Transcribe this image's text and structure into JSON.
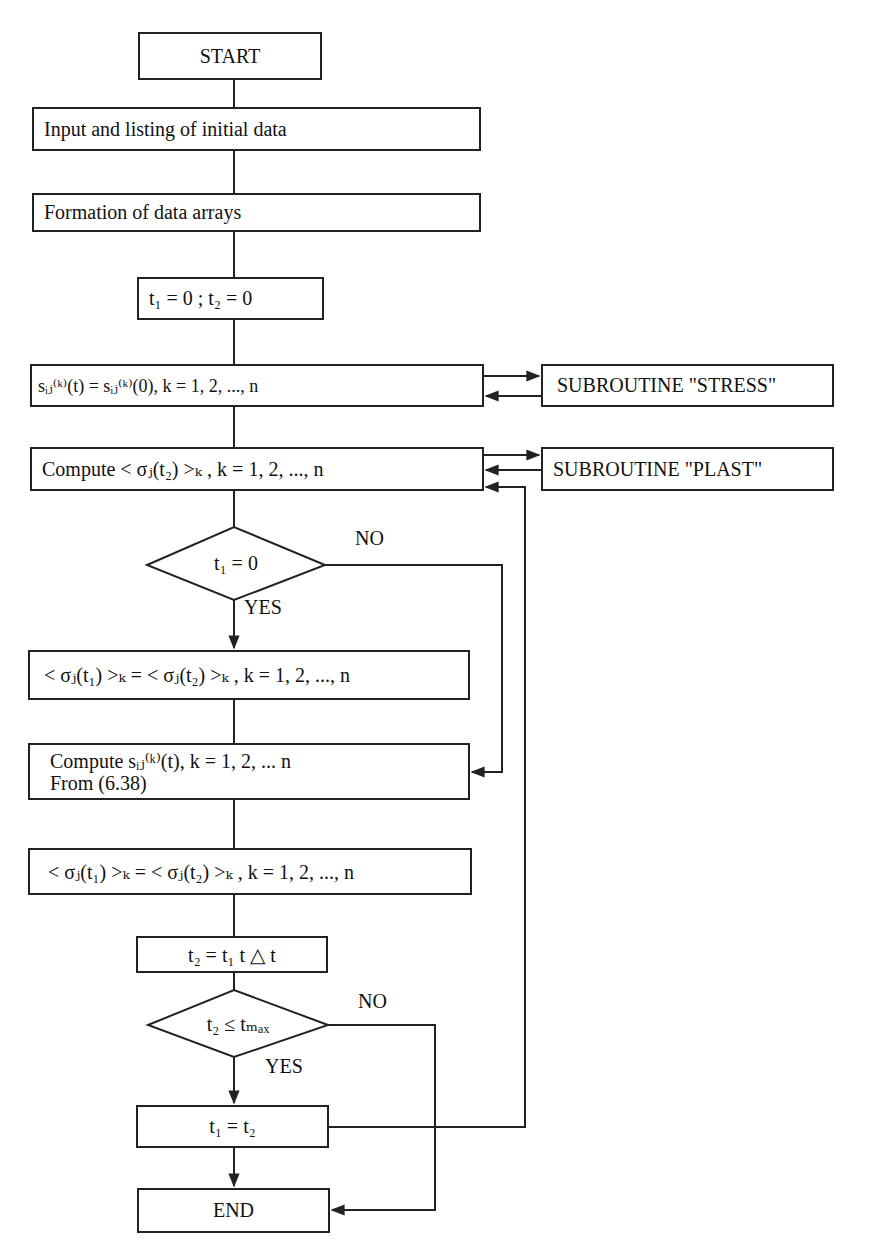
{
  "flowchart": {
    "start": "START",
    "input": "Input and listing of initial data",
    "formation": "Formation of data arrays",
    "init_t": "t₁ = 0 ; t₂ = 0",
    "init_s": "sᵢⱼ⁽ᵏ⁾(t) = sᵢⱼ⁽ᵏ⁾(0), k = 1, 2, ..., n",
    "compute_sigma": "Compute < σⱼ(t₂) >ₖ , k = 1, 2, ..., n",
    "decision1": "t₁ = 0",
    "decision1_no": "NO",
    "decision1_yes": "YES",
    "assign_sigma_1": "< σⱼ(t₁) >ₖ = < σⱼ(t₂) >ₖ , k = 1, 2, ..., n",
    "compute_s_line1": "Compute sᵢⱼ⁽ᵏ⁾(t), k = 1, 2, ... n",
    "compute_s_line2": "From (6.38)",
    "assign_sigma_2": "< σⱼ(t₁) >ₖ = < σⱼ(t₂) >ₖ , k = 1, 2, ..., n",
    "step_t": "t₂ = t₁ t △ t",
    "decision2": "t₂ ≤ tₘₐₓ",
    "decision2_no": "NO",
    "decision2_yes": "YES",
    "update_t": "t₁ = t₂",
    "end": "END"
  },
  "subroutines": {
    "stress": "SUBROUTINE \"STRESS\"",
    "plast": "SUBROUTINE \"PLAST\""
  }
}
